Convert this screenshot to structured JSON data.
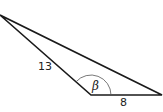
{
  "diagram": {
    "type": "triangle",
    "vertices": {
      "top_left": [
        0,
        15
      ],
      "bottom_middle": [
        91,
        95
      ],
      "bottom_right": [
        162,
        95
      ]
    },
    "sides": [
      {
        "name": "left-side",
        "label": "13"
      },
      {
        "name": "bottom-side",
        "label": "8"
      },
      {
        "name": "long-side",
        "label": ""
      }
    ],
    "angle": {
      "label": "β",
      "vertex": "bottom_middle"
    },
    "colors": {
      "stroke": "#1a1a1a",
      "arc": "#555555"
    }
  }
}
